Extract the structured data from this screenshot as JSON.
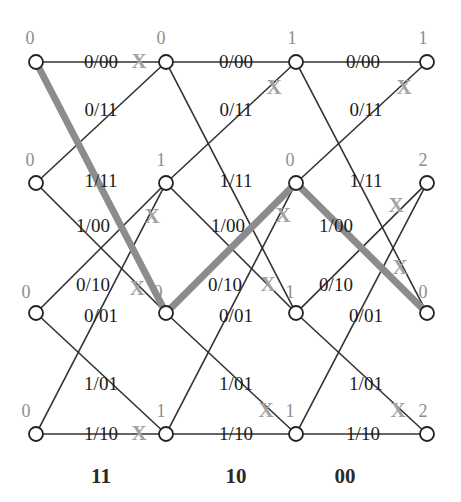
{
  "figure": {
    "colors": {
      "edge": "#333333",
      "node_stroke": "#222222",
      "node_fill": "#ffffff",
      "survivor_path": "#8c8c8c",
      "metric_text": "#8d8d8d",
      "x_mark": "#a2a2a2",
      "label_text": "#1b1b1b",
      "column_code": "#2a2a2a",
      "background": "#ffffff"
    },
    "geometry": {
      "columns_x": [
        36,
        166,
        296,
        427
      ],
      "rows_y": [
        62,
        183,
        313,
        434
      ],
      "node_radius": 7
    }
  },
  "received_codewords": [
    {
      "label": "11",
      "x": 101,
      "y": 476
    },
    {
      "label": "10",
      "x": 236,
      "y": 476
    },
    {
      "label": "00",
      "x": 345,
      "y": 476
    }
  ],
  "state_metrics": [
    {
      "value": "0",
      "x": 30,
      "y": 38,
      "col": 0,
      "row": 0
    },
    {
      "value": "0",
      "x": 30,
      "y": 160,
      "col": 0,
      "row": 1
    },
    {
      "value": "0",
      "x": 26,
      "y": 292,
      "col": 0,
      "row": 2
    },
    {
      "value": "0",
      "x": 26,
      "y": 411,
      "col": 0,
      "row": 3
    },
    {
      "value": "0",
      "x": 161,
      "y": 38,
      "col": 1,
      "row": 0
    },
    {
      "value": "1",
      "x": 161,
      "y": 160,
      "col": 1,
      "row": 1
    },
    {
      "value": "0",
      "x": 158,
      "y": 292,
      "col": 1,
      "row": 2
    },
    {
      "value": "1",
      "x": 161,
      "y": 411,
      "col": 1,
      "row": 3
    },
    {
      "value": "1",
      "x": 292,
      "y": 38,
      "col": 2,
      "row": 0
    },
    {
      "value": "0",
      "x": 290,
      "y": 160,
      "col": 2,
      "row": 1
    },
    {
      "value": "1",
      "x": 290,
      "y": 292,
      "col": 2,
      "row": 2
    },
    {
      "value": "1",
      "x": 290,
      "y": 411,
      "col": 2,
      "row": 3
    },
    {
      "value": "1",
      "x": 423,
      "y": 38,
      "col": 3,
      "row": 0
    },
    {
      "value": "2",
      "x": 423,
      "y": 160,
      "col": 3,
      "row": 1
    },
    {
      "value": "0",
      "x": 423,
      "y": 292,
      "col": 3,
      "row": 2
    },
    {
      "value": "2",
      "x": 423,
      "y": 411,
      "col": 3,
      "row": 3
    }
  ],
  "branch_labels": [
    {
      "text": "0/00",
      "x": 101,
      "y": 62
    },
    {
      "text": "0/00",
      "x": 236,
      "y": 62
    },
    {
      "text": "0/00",
      "x": 363,
      "y": 62
    },
    {
      "text": "0/11",
      "x": 101,
      "y": 110
    },
    {
      "text": "0/11",
      "x": 236,
      "y": 110
    },
    {
      "text": "0/11",
      "x": 366,
      "y": 110
    },
    {
      "text": "1/11",
      "x": 101,
      "y": 181
    },
    {
      "text": "1/11",
      "x": 236,
      "y": 181
    },
    {
      "text": "1/11",
      "x": 366,
      "y": 181
    },
    {
      "text": "1/00",
      "x": 93,
      "y": 226
    },
    {
      "text": "1/00",
      "x": 228,
      "y": 226
    },
    {
      "text": "1/00",
      "x": 336,
      "y": 226
    },
    {
      "text": "0/10",
      "x": 93,
      "y": 285
    },
    {
      "text": "0/10",
      "x": 225,
      "y": 285
    },
    {
      "text": "0/10",
      "x": 336,
      "y": 285
    },
    {
      "text": "0/01",
      "x": 101,
      "y": 316
    },
    {
      "text": "0/01",
      "x": 236,
      "y": 316
    },
    {
      "text": "0/01",
      "x": 366,
      "y": 316
    },
    {
      "text": "1/01",
      "x": 101,
      "y": 384
    },
    {
      "text": "1/01",
      "x": 236,
      "y": 384
    },
    {
      "text": "1/01",
      "x": 366,
      "y": 384
    },
    {
      "text": "1/10",
      "x": 101,
      "y": 434
    },
    {
      "text": "1/10",
      "x": 236,
      "y": 434
    },
    {
      "text": "1/10",
      "x": 363,
      "y": 434
    }
  ],
  "pruned_marks": [
    {
      "text": "X",
      "x": 139,
      "y": 61
    },
    {
      "text": "X",
      "x": 274,
      "y": 87
    },
    {
      "text": "X",
      "x": 404,
      "y": 87
    },
    {
      "text": "X",
      "x": 152,
      "y": 216
    },
    {
      "text": "X",
      "x": 283,
      "y": 215
    },
    {
      "text": "X",
      "x": 396,
      "y": 205
    },
    {
      "text": "X",
      "x": 137,
      "y": 288
    },
    {
      "text": "X",
      "x": 268,
      "y": 284
    },
    {
      "text": "X",
      "x": 400,
      "y": 267
    },
    {
      "text": "X",
      "x": 139,
      "y": 433
    },
    {
      "text": "X",
      "x": 266,
      "y": 410
    },
    {
      "text": "X",
      "x": 398,
      "y": 410
    }
  ],
  "chart_data": {
    "type": "diagram",
    "name": "convolutional-code-viterbi-trellis",
    "states": [
      "00",
      "01",
      "10",
      "11"
    ],
    "stages": 4,
    "received_sequence": [
      "11",
      "10",
      "00"
    ],
    "node_path_metrics": [
      [
        0,
        0,
        0,
        0
      ],
      [
        0,
        1,
        0,
        1
      ],
      [
        1,
        0,
        1,
        1
      ],
      [
        1,
        2,
        0,
        2
      ]
    ],
    "branch_label_grid": {
      "row0_horizontal": "0/00",
      "row0_down": "0/11",
      "row1_up": "1/11",
      "row1_down": "1/00",
      "row2_up": "0/10",
      "row2_horizontal": "0/01",
      "row3_up": "1/01",
      "row3_horizontal": "1/10"
    },
    "survivor_path_nodes": [
      {
        "col": 0,
        "row": 0
      },
      {
        "col": 1,
        "row": 2
      },
      {
        "col": 2,
        "row": 1
      },
      {
        "col": 3,
        "row": 2
      }
    ],
    "pruned_branch_count": 12
  }
}
